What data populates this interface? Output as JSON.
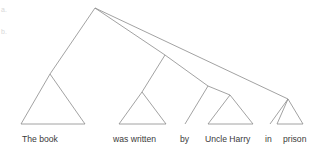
{
  "figure": {
    "kind": "syntax-tree-diagram",
    "line_color": "#8a8a8a",
    "text_color": "#3a3a3a",
    "background": "#ffffff",
    "width": 325,
    "height": 155
  },
  "sentence": "The book was written by Uncle Harry in prison",
  "terminals": [
    {
      "id": "the-book",
      "text": "The book",
      "x": 22,
      "y": 143
    },
    {
      "id": "was-written",
      "text": "was written",
      "x": 113,
      "y": 143
    },
    {
      "id": "by",
      "text": "by",
      "x": 180,
      "y": 143
    },
    {
      "id": "uncle-harry",
      "text": "Uncle Harry",
      "x": 205,
      "y": 143
    },
    {
      "id": "in",
      "text": "in",
      "x": 265,
      "y": 143
    },
    {
      "id": "prison",
      "text": "prison",
      "x": 283,
      "y": 143
    }
  ],
  "margin_marks": [
    {
      "id": "mark-a",
      "text": "a.",
      "x": 1,
      "y": 14
    },
    {
      "id": "mark-b",
      "text": "b.",
      "x": 1,
      "y": 36
    }
  ],
  "nodes": [
    {
      "id": "root",
      "x": 95,
      "y": 8
    },
    {
      "id": "vp",
      "x": 165,
      "y": 55
    },
    {
      "id": "pp-by",
      "x": 208,
      "y": 86
    }
  ],
  "branches": [
    {
      "id": "root-to-subject",
      "x1": 95,
      "y1": 8,
      "x2": 50,
      "y2": 74
    },
    {
      "id": "root-to-vp",
      "x1": 95,
      "y1": 8,
      "x2": 165,
      "y2": 55
    },
    {
      "id": "root-to-pp-in",
      "x1": 95,
      "y1": 8,
      "x2": 288,
      "y2": 99
    },
    {
      "id": "vp-to-verb",
      "x1": 165,
      "y1": 55,
      "x2": 142,
      "y2": 92
    },
    {
      "id": "vp-to-pp-by",
      "x1": 165,
      "y1": 55,
      "x2": 208,
      "y2": 86
    },
    {
      "id": "pp-by-to-by",
      "x1": 208,
      "y1": 86,
      "x2": 185,
      "y2": 124
    },
    {
      "id": "pp-by-to-uncle-harry",
      "x1": 208,
      "y1": 86,
      "x2": 230,
      "y2": 95
    },
    {
      "id": "pp-in-to-in",
      "x1": 288,
      "y1": 99,
      "x2": 270,
      "y2": 124
    }
  ],
  "triangles": [
    {
      "id": "triangle-the-book",
      "apex_x": 50,
      "apex_y": 74,
      "left_x": 21,
      "right_x": 85,
      "base_y": 124
    },
    {
      "id": "triangle-was-written",
      "apex_x": 142,
      "apex_y": 92,
      "left_x": 119,
      "right_x": 166,
      "base_y": 124
    },
    {
      "id": "triangle-uncle-harry",
      "apex_x": 230,
      "apex_y": 95,
      "left_x": 208,
      "right_x": 253,
      "base_y": 124
    },
    {
      "id": "triangle-prison",
      "apex_x": 288,
      "apex_y": 99,
      "left_x": 277,
      "right_x": 303,
      "base_y": 124,
      "left_edge_vertical": true
    }
  ]
}
